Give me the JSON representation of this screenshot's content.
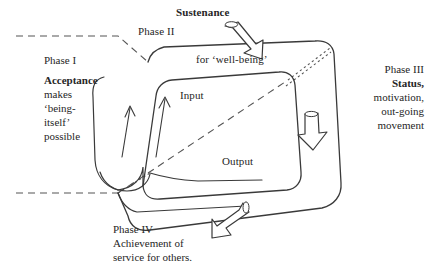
{
  "diagram": {
    "title_visible": false,
    "colors": {
      "ink": "#262626",
      "stroke": "#3a3a3a",
      "background": "#ffffff"
    },
    "phase_one": {
      "phase_label": "Phase I",
      "line_bold": "Acceptance",
      "line2": "makes",
      "line3": "‘being-",
      "line4": "itself’",
      "line5": "possible"
    },
    "phase_two": {
      "phase_label": "Phase II",
      "heading_bold": "Sustenance",
      "subtitle": "for ‘well-being’"
    },
    "phase_three": {
      "phase_label": "Phase III",
      "line_bold": "Status,",
      "line2": "motivation,",
      "line3": "out-going",
      "line4": "movement"
    },
    "phase_four": {
      "phase_label": "Phase IV",
      "line_bold": "Achievement",
      "line_bold_tail": " of",
      "line2": "service for others."
    },
    "flow_labels": {
      "input": "Input",
      "output": "Output"
    },
    "icons": {
      "sustenance_arrow": "block-arrow-down-right-icon",
      "status_arrow": "block-arrow-down-icon",
      "achievement_arrow": "block-arrow-down-left-icon",
      "input_arrow_left": "thin-arrow-up-icon",
      "input_arrow_right": "thin-arrow-up-icon"
    }
  }
}
